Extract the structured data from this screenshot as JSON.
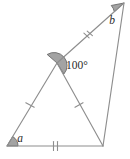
{
  "figure": {
    "kind": "geometry-diagram",
    "width": 130,
    "height": 159,
    "background_color": "#ffffff",
    "stroke_color": "#8e8e8e",
    "stroke_color_dark": "#6f6f6f",
    "angle_fill_color": "#a3a3a3",
    "angle_stroke_color": "#6b6b6b",
    "label_color": "#2b2b2b",
    "vertices": [
      {
        "id": "A",
        "x": 7,
        "y": 146,
        "role": "bottom-left"
      },
      {
        "id": "C",
        "x": 57,
        "y": 63,
        "role": "interior-apex"
      },
      {
        "id": "B",
        "x": 124,
        "y": 3,
        "role": "top-right"
      },
      {
        "id": "D",
        "x": 103,
        "y": 146,
        "role": "bottom-right"
      }
    ],
    "edges": [
      {
        "id": "AC",
        "from": "A",
        "to": "C",
        "ticks": 1
      },
      {
        "id": "CB",
        "from": "C",
        "to": "B",
        "ticks": 2
      },
      {
        "id": "BD",
        "from": "B",
        "to": "D",
        "ticks": 0
      },
      {
        "id": "AD",
        "from": "A",
        "to": "D",
        "ticks": 2
      },
      {
        "id": "CD",
        "from": "C",
        "to": "D",
        "ticks": 1
      }
    ],
    "angles": [
      {
        "id": "angle-a",
        "at": "A",
        "label": "a",
        "label_style": "italic",
        "label_x": 20,
        "label_y": 142,
        "shaded": true,
        "radius": 11,
        "start_deg": -59,
        "end_deg": 0
      },
      {
        "id": "angle-100",
        "at": "C",
        "label": "100°",
        "label_style": "upright",
        "label_x": 66,
        "label_y": 69,
        "shaded": true,
        "radius": 13,
        "start_deg": 58,
        "end_deg": 139
      },
      {
        "id": "angle-b",
        "at": "B",
        "label": "b",
        "label_style": "italic",
        "label_x": 112,
        "label_y": 24,
        "shaded": true,
        "radius": 13,
        "start_deg": 138,
        "end_deg": 191
      }
    ],
    "tick_marks": [
      {
        "id": "tick-AC",
        "edge": "AC",
        "count": 1,
        "cx": 30,
        "cy": 105
      },
      {
        "id": "tick-CB",
        "edge": "CB",
        "count": 2,
        "cx": 88,
        "cy": 36
      },
      {
        "id": "tick-AD",
        "edge": "AD",
        "count": 2,
        "cx": 56,
        "cy": 146
      },
      {
        "id": "tick-CD",
        "edge": "CD",
        "count": 1,
        "cx": 79,
        "cy": 105
      }
    ],
    "known_angle_value": "100°",
    "unknown_angle_labels": [
      "a",
      "b"
    ]
  }
}
